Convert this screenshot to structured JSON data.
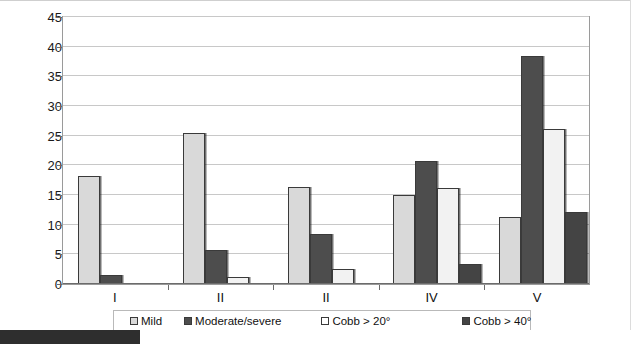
{
  "chart_data": {
    "type": "bar",
    "title": "",
    "subtitle": "",
    "xlabel": "",
    "ylabel": "",
    "categories": [
      "I",
      "II",
      "II",
      "IV",
      "V"
    ],
    "ylim": [
      0,
      45
    ],
    "yticks": [
      0,
      5,
      10,
      15,
      20,
      25,
      30,
      35,
      40,
      45
    ],
    "ytick_labels": [
      "0",
      "5",
      "10",
      "15",
      "20",
      "25",
      "30",
      "35",
      "40",
      "45"
    ],
    "grid": true,
    "legend_position": "bottom",
    "series": [
      {
        "name": "Mild",
        "color": "#d9d9d9",
        "values": [
          18.2,
          25.5,
          16.4,
          15.0,
          11.3
        ]
      },
      {
        "name": "Moderate/severe",
        "color": "#4d4d4d",
        "values": [
          1.5,
          5.7,
          8.5,
          20.8,
          38.5
        ]
      },
      {
        "name": "Cobb > 20°",
        "color": "#ffffff",
        "values": [
          null,
          1.2,
          2.5,
          16.2,
          26.2
        ]
      },
      {
        "name": "Cobb > 40°",
        "color": "#444444",
        "values": [
          null,
          null,
          null,
          3.4,
          12.1
        ]
      }
    ]
  },
  "legend": {
    "items": [
      {
        "label": "Mild"
      },
      {
        "label": "Moderate/severe"
      },
      {
        "label": "Cobb > 20°"
      },
      {
        "label": "Cobb > 40°"
      }
    ]
  }
}
